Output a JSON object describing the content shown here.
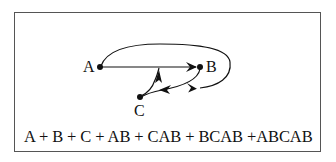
{
  "diagram": {
    "nodes": [
      {
        "id": "A",
        "label": "A",
        "x": 100,
        "y": 67
      },
      {
        "id": "B",
        "label": "B",
        "x": 200,
        "y": 67
      },
      {
        "id": "C",
        "label": "C",
        "x": 140,
        "y": 97
      }
    ],
    "edges": [
      {
        "from": "A",
        "to": "B",
        "type": "straight"
      },
      {
        "from": "B",
        "to": "C",
        "type": "curve"
      },
      {
        "from": "C",
        "to": "A-B edge",
        "type": "curve"
      },
      {
        "from": "A",
        "to": "C",
        "type": "loop-over-B"
      }
    ],
    "formula": "A + B + C + AB + CAB + BCAB +ABCAB"
  },
  "colors": {
    "line": "#111111",
    "border": "#555555",
    "background": "#ffffff"
  }
}
